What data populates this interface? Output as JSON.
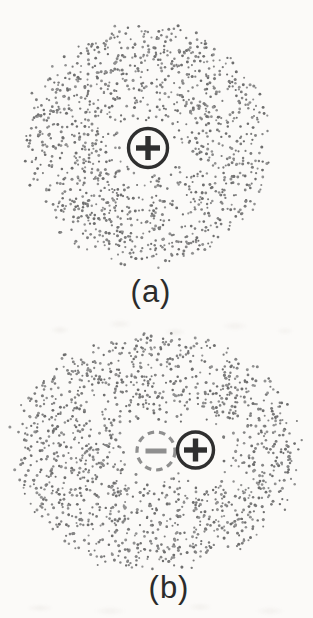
{
  "colors": {
    "paper": "#fbfaf8",
    "ink": "#2f2f2f",
    "dash_gray": "#8f8f8f",
    "minus_gray": "#8f8f8f",
    "dot_shades": [
      "#6e6e6e",
      "#7b7b7b",
      "#868686",
      "#929292"
    ]
  },
  "figures": [
    {
      "name": "figure-a",
      "label": "(a)",
      "cloud": {
        "cx": 148,
        "cy": 145,
        "rx": 125,
        "ry": 122,
        "dots": 1250,
        "seed": 12,
        "radial_exp": 0.5,
        "holes": [
          {
            "x": 148,
            "y": 148,
            "r": 27,
            "fade": 32
          }
        ]
      },
      "symbols": [
        {
          "name": "nucleus-plus-symbol",
          "sign": "+",
          "x": 148,
          "y": 148,
          "r": 19.5,
          "style": "solid",
          "stroke": 3.4,
          "arm": 12,
          "arm_w": 5.4
        }
      ]
    },
    {
      "name": "figure-b",
      "label": "(b)",
      "cloud": {
        "cx": 156,
        "cy": 451,
        "rx": 146,
        "ry": 121,
        "dots": 1400,
        "seed": 99,
        "radial_exp": 0.5,
        "holes": [
          {
            "x": 155,
            "y": 451,
            "r": 30,
            "fade": 26
          },
          {
            "x": 196,
            "y": 450,
            "r": 29,
            "fade": 24
          }
        ]
      },
      "symbols": [
        {
          "name": "electron-cloud-center-minus-symbol",
          "sign": "-",
          "x": 156,
          "y": 451,
          "r": 19,
          "style": "dashed",
          "stroke": 3.2,
          "arm": 10.5,
          "arm_w": 5,
          "dash": "6.5 5"
        },
        {
          "name": "nucleus-plus-symbol",
          "sign": "+",
          "x": 195.5,
          "y": 450,
          "r": 18,
          "style": "solid",
          "stroke": 3.4,
          "arm": 11.5,
          "arm_w": 5.4
        }
      ]
    }
  ]
}
